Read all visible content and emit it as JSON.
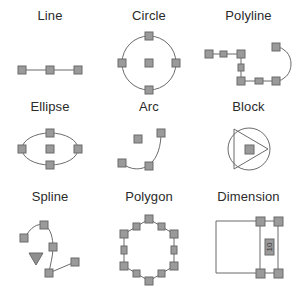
{
  "page": {
    "background_color": "#ffffff",
    "line_color": "#6b6b6b",
    "grip_fill_color": "#9a9a9a",
    "grip_stroke_color": "#6b6b6b",
    "text_color": "#2b2b2b"
  },
  "entities": [
    {
      "label": "Line",
      "icon": "line-entity-icon",
      "description": "Straight line segment with two endpoint grips and one midpoint grip",
      "grip_count": 3
    },
    {
      "label": "Circle",
      "icon": "circle-entity-icon",
      "description": "Circle with four quadrant grips and one center grip",
      "grip_count": 5
    },
    {
      "label": "Polyline",
      "icon": "polyline-entity-icon",
      "description": "Polyline with straight and arc segments, vertex grips and segment midpoint grips",
      "grip_count": 8
    },
    {
      "label": "Ellipse",
      "icon": "ellipse-entity-icon",
      "description": "Ellipse with four quadrant grips and one center grip",
      "grip_count": 5
    },
    {
      "label": "Arc",
      "icon": "arc-entity-icon",
      "description": "Arc with two endpoint grips, a midpoint grip and a center grip",
      "grip_count": 4
    },
    {
      "label": "Block",
      "icon": "block-entity-icon",
      "description": "Block reference drawn as a circle with inscribed triangle and a single insertion point grip",
      "grip_count": 1
    },
    {
      "label": "Spline",
      "icon": "spline-entity-icon",
      "description": "Spline with fit point grips and a downward triangular control marker",
      "grip_count": 5
    },
    {
      "label": "Polygon",
      "icon": "polygon-entity-icon",
      "description": "Hexagon with six vertex grips and six edge midpoint grips",
      "grip_count": 12
    },
    {
      "label": "Dimension",
      "icon": "dimension-entity-icon",
      "description": "Linear dimension with extension lines, dimension line, text grip and four definition point grips",
      "grip_count": 5,
      "text": "10"
    }
  ]
}
